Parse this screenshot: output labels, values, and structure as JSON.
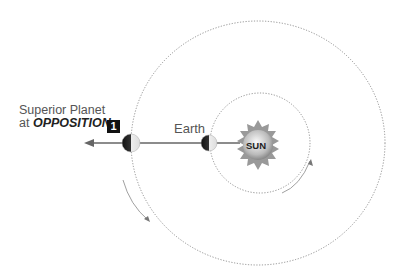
{
  "diagram": {
    "labels": {
      "planet_line1": "Superior Planet",
      "planet_line2_prefix": "at ",
      "planet_line2_emphasis": "OPPOSITION",
      "earth": "Earth",
      "sun": "SUN",
      "badge": "1"
    },
    "colors": {
      "orbit": "#777777",
      "line": "#666666",
      "badge_bg": "#111111",
      "text": "#555555"
    }
  }
}
